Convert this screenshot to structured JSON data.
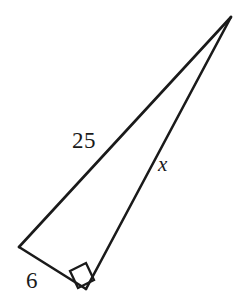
{
  "figure": {
    "type": "right-triangle-diagram",
    "background_color": "#ffffff",
    "stroke_color": "#1a1a1a",
    "text_color": "#1a1a1a",
    "stroke_width": 2.5,
    "vertices": {
      "apex": {
        "name": "apex-vertex",
        "x": 231,
        "y": 17
      },
      "left": {
        "name": "left-vertex",
        "x": 19,
        "y": 247
      },
      "right_angle": {
        "name": "right-angle-vertex",
        "x": 86,
        "y": 289
      }
    },
    "edges": [
      {
        "name": "hypotenuse",
        "from": "left",
        "to": "apex",
        "label": "25"
      },
      {
        "name": "long-leg",
        "from": "right_angle",
        "to": "apex",
        "label": "x"
      },
      {
        "name": "short-leg",
        "from": "left",
        "to": "right_angle",
        "label": "6"
      }
    ],
    "right_angle_marker": {
      "name": "right-angle-square",
      "at_vertex": "right_angle",
      "size": 22,
      "points": "70,271 86,263 94,280 78,288"
    },
    "labels": {
      "hypotenuse": "25",
      "long_leg": "x",
      "short_leg": "6"
    },
    "paths": {
      "hypotenuse": "M 19 247 L 231 17",
      "long_leg": "M 86 289 L 231 17",
      "short_leg": "M 19 247 L 86 289"
    }
  }
}
